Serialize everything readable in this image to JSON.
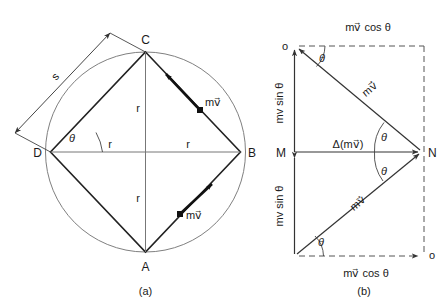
{
  "figure": {
    "title": "",
    "panels": [
      {
        "id": "a",
        "caption": "(a)",
        "description": "Square ABCD inscribed in a circle of radius r, with momentum vectors m v at B-side edges",
        "points": [
          {
            "name": "C",
            "label": "C"
          },
          {
            "name": "B",
            "label": "B"
          },
          {
            "name": "A",
            "label": "A"
          },
          {
            "name": "D",
            "label": "D"
          }
        ],
        "radius_labels": [
          "r",
          "r",
          "r",
          "r"
        ],
        "side_label": "s",
        "angle_label": "θ",
        "vector_labels": [
          "mv⃗",
          "mv⃗"
        ]
      },
      {
        "id": "b",
        "caption": "(b)",
        "description": "Vector triangle showing change in momentum Δ(mv) between incoming and outgoing momentum vectors",
        "points": [
          {
            "name": "M",
            "label": "M"
          },
          {
            "name": "N",
            "label": "N"
          },
          {
            "name": "origin-top",
            "label": "o"
          },
          {
            "name": "origin-bottom",
            "label": "o"
          }
        ],
        "top_component_label": "mv⃗ cos θ",
        "bottom_component_label": "mv⃗ cos θ",
        "left_top_component_label": "mv sin θ",
        "left_bottom_component_label": "mv sin θ",
        "delta_label": "Δ(mv⃗)",
        "vector_labels": [
          "mv⃗",
          "mv⃗"
        ],
        "angle_labels": [
          "θ",
          "θ",
          "θ",
          "θ"
        ]
      }
    ],
    "colors": {
      "stroke": "#1a1a1a",
      "thin_stroke": "#555555",
      "circle": "#707070",
      "background": "#ffffff"
    }
  }
}
